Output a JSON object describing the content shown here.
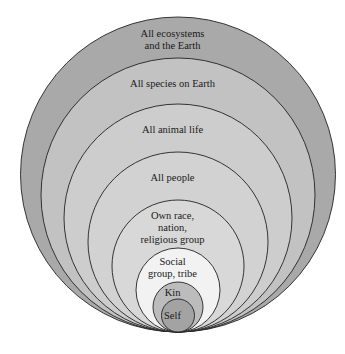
{
  "diagram": {
    "type": "nested-circles",
    "tangent_point": {
      "x": 178,
      "y": 332
    },
    "rings": [
      {
        "label_lines": [
          "All ecosystems",
          "and the Earth"
        ],
        "radius": 157.5,
        "fill": "#a9a9a9",
        "label_top": 28
      },
      {
        "label_lines": [
          "All species on Earth"
        ],
        "radius": 137,
        "fill": "#c2c2c2",
        "label_top": 78
      },
      {
        "label_lines": [
          "All animal life"
        ],
        "radius": 114,
        "fill": "#cdcdcd",
        "label_top": 124
      },
      {
        "label_lines": [
          "All people"
        ],
        "radius": 90,
        "fill": "#d2d2d2",
        "label_top": 172
      },
      {
        "label_lines": [
          "Own race,",
          "nation,",
          "religious group"
        ],
        "radius": 66,
        "fill": "#d8d8d8",
        "label_top": 210
      },
      {
        "label_lines": [
          "Social",
          "group, tribe"
        ],
        "radius": 42,
        "fill": "#f2f2f2",
        "label_top": 255
      },
      {
        "label_lines": [
          "Kin"
        ],
        "radius": 25,
        "fill": "#bcbcbc",
        "label_top": 287
      },
      {
        "label_lines": [
          "Self"
        ],
        "radius": 16.5,
        "fill": "#a3a3a3",
        "label_top": 311
      }
    ]
  },
  "labels": {
    "ecosystems_1": "All ecosystems",
    "ecosystems_2": "and the Earth",
    "species": "All species on Earth",
    "animal": "All animal life",
    "people": "All people",
    "race_1": "Own race,",
    "race_2": "nation,",
    "race_3": "religious group",
    "social_1": "Social",
    "social_2": "group, tribe",
    "kin": "Kin",
    "self": "Self"
  }
}
